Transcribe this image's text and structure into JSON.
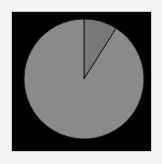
{
  "chart_data": {
    "type": "pie",
    "title": "",
    "labels": [
      "",
      ""
    ],
    "values": [
      9,
      91
    ],
    "series": [
      {
        "name": "slice-small",
        "value": 9,
        "color": "#787878"
      },
      {
        "name": "slice-large",
        "value": 91,
        "color": "#8a8a8a"
      }
    ],
    "start_angle_deg": 0,
    "direction": "clockwise",
    "legend": "none",
    "background": "#000000",
    "outline_color": "#1a1a1a"
  },
  "layout": {
    "cx": 84,
    "cy": 79,
    "r": 60
  }
}
